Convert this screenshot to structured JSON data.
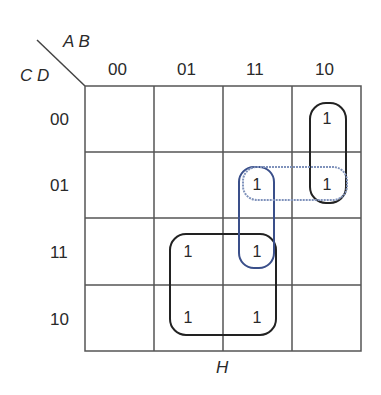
{
  "title_var_row": "A B",
  "title_var_col": "C D",
  "function_name": "H",
  "col_headers": [
    "00",
    "01",
    "11",
    "10"
  ],
  "row_headers": [
    "00",
    "01",
    "11",
    "10"
  ],
  "cells": [
    [
      "",
      "",
      "",
      "1"
    ],
    [
      "",
      "",
      "1",
      "1"
    ],
    [
      "",
      "1",
      "1",
      ""
    ],
    [
      "",
      "1",
      "1",
      ""
    ]
  ],
  "colors": {
    "grid": "#555555",
    "group_black": "#222222",
    "group_blue": "#3a4f8a",
    "group_lightblue": "#7f92bb"
  }
}
